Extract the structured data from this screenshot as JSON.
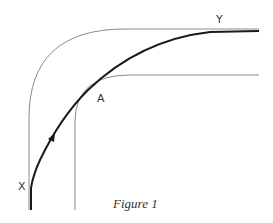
{
  "figure": {
    "caption": "Figure 1",
    "labels": {
      "start": "X",
      "end": "Y",
      "apex": "A"
    }
  },
  "diagram": {
    "type": "road-bend-racing-line",
    "elements": [
      {
        "name": "outer-road-edge",
        "description": "Outer edge of a 90-degree bend, vertical then curving right to horizontal"
      },
      {
        "name": "inner-road-edge",
        "description": "Inner edge of the bend, tighter curve"
      },
      {
        "name": "driving-line",
        "description": "Thick path from X to Y touching inner edge near apex A"
      },
      {
        "name": "direction-arrow",
        "description": "Arrowhead on the driving line showing travel direction from X toward Y"
      }
    ]
  },
  "colors": {
    "edge": "#8a8a8a",
    "path": "#1a1a1a",
    "text": "#333333"
  }
}
